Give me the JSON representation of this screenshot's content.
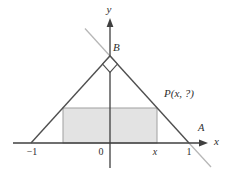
{
  "figure": {
    "labels": {
      "y_axis": "y",
      "x_axis": "x",
      "point_b": "B",
      "point_p": "P(x, ?)",
      "point_a": "A",
      "tick_neg1": "−1",
      "origin": "0",
      "tick_x": "x",
      "tick_1": "1"
    },
    "colors": {
      "axis": "#3f3f3f",
      "line_dark": "#4f4f4f",
      "line_light": "#b7b7b7",
      "rect_fill": "#e3e3e3",
      "rect_border": "#a0a0a0",
      "marker_fill": "#ffffff",
      "text": "#2e2e2e"
    }
  }
}
